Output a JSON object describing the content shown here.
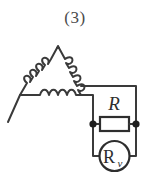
{
  "figure": {
    "caption": "(3)",
    "background_color": "#ffffff",
    "line_color": "#3a3a3a",
    "label_color": "#2e2e2e",
    "width": 150,
    "height": 191
  },
  "circuit": {
    "type": "delta-connected-winding-with-resistor-and-meter",
    "source": {
      "name": "delta-winding",
      "shape": "triangle",
      "windings": [
        {
          "id": "left-winding",
          "side": "left",
          "bumps": 4
        },
        {
          "id": "right-winding",
          "side": "right",
          "bumps": 4
        },
        {
          "id": "bottom-winding",
          "side": "bottom",
          "bumps": 4
        }
      ]
    },
    "components": [
      {
        "id": "resistor-R",
        "symbol": "rectangle",
        "label": "R",
        "label_position": "above"
      },
      {
        "id": "meter-Rv",
        "symbol": "circle",
        "label_main": "R",
        "label_subscript": "v",
        "label_full": "Rv"
      }
    ],
    "nodes": [
      {
        "id": "node-left",
        "label": ""
      },
      {
        "id": "node-right",
        "label": ""
      }
    ]
  }
}
